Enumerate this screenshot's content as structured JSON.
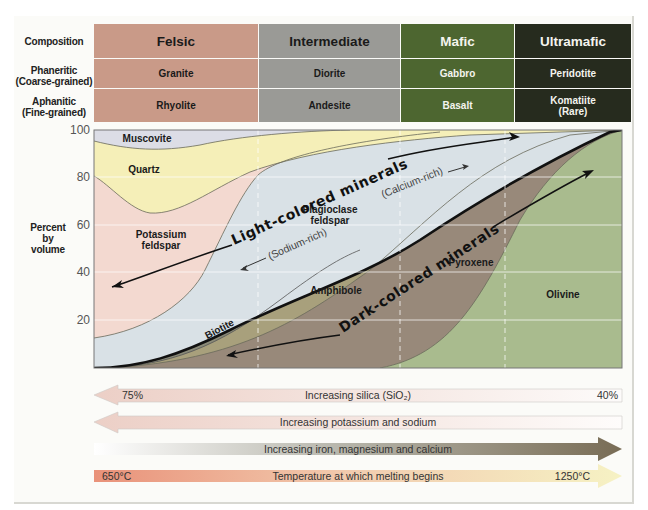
{
  "table": {
    "row_labels": {
      "composition": "Composition",
      "phaneritic": [
        "Phaneritic",
        "(Coarse-grained)"
      ],
      "aphanitic": [
        "Aphanitic",
        "(Fine-grained)"
      ]
    },
    "columns": [
      {
        "composition": "Felsic",
        "phaneritic": "Granite",
        "aphanitic": "Rhyolite",
        "color": "#c99a88",
        "text_color": "#1a1a1a"
      },
      {
        "composition": "Intermediate",
        "phaneritic": "Diorite",
        "aphanitic": "Andesite",
        "color": "#9a9a96",
        "text_color": "#1a1a1a"
      },
      {
        "composition": "Mafic",
        "phaneritic": "Gabbro",
        "aphanitic": "Basalt",
        "color": "#4d6630",
        "text_color": "#f4f4ee"
      },
      {
        "composition": "Ultramafic",
        "phaneritic": "Peridotite",
        "aphanitic": "Komatiite",
        "aphanitic_note": "(Rare)",
        "color": "#262b1e",
        "text_color": "#f4f4ee"
      }
    ]
  },
  "chart": {
    "y_axis": {
      "label": [
        "Percent",
        "by",
        "volume"
      ],
      "ticks": [
        "100",
        "80",
        "60",
        "40",
        "20"
      ]
    },
    "minerals": {
      "muscovite": "Muscovite",
      "quartz": "Quartz",
      "potassium_feldspar": [
        "Potassium",
        "feldspar"
      ],
      "plagioclase": [
        "Plagioclase",
        "feldspar"
      ],
      "biotite": "Biotite",
      "amphibole": "Amphibole",
      "pyroxene": "Pyroxene",
      "olivine": "Olivine"
    },
    "annotations": {
      "light": "Light-colored minerals",
      "dark": "Dark-colored minerals",
      "sodium": "(Sodium-rich)",
      "calcium": "(Calcium-rich)"
    },
    "colors": {
      "muscovite": "#dcdde6",
      "quartz": "#f5efb8",
      "potassium_feldspar": "#f3d9d0",
      "plagioclase": "#d9e1e6",
      "biotite": "#8a8a78",
      "amphibole": "#a8a07c",
      "pyroxene": "#98897a",
      "olivine": "#a9bb8e"
    }
  },
  "bars": [
    {
      "id": "silica",
      "text": "Increasing silica (SiO₂)",
      "left": "75%",
      "right": "40%",
      "direction": "left"
    },
    {
      "id": "potassium_sodium",
      "text": "Increasing potassium and sodium",
      "direction": "left"
    },
    {
      "id": "iron_magnesium_calcium",
      "text": "Increasing iron, magnesium and calcium",
      "direction": "right"
    },
    {
      "id": "temperature",
      "text": "Temperature at which melting begins",
      "left": "650°C",
      "right": "1250°C",
      "direction": "right"
    }
  ]
}
